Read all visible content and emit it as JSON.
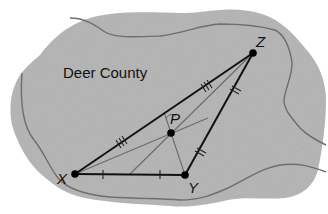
{
  "region": {
    "label": "Deer County",
    "fill": "#b9b9b9",
    "border_color": "#6e6e6e"
  },
  "points": {
    "X": {
      "label": "X",
      "x": 75,
      "y": 174
    },
    "Y": {
      "label": "Y",
      "x": 185,
      "y": 175
    },
    "Z": {
      "label": "Z",
      "x": 253,
      "y": 53
    },
    "P": {
      "label": "P",
      "x": 171,
      "y": 133
    }
  },
  "triangle": {
    "sides": [
      {
        "from": "X",
        "to": "Y",
        "tick_marks": 1,
        "tick_count": 2
      },
      {
        "from": "Y",
        "to": "Z",
        "tick_marks": 2,
        "tick_count": 2
      },
      {
        "from": "X",
        "to": "Z",
        "tick_marks": 3,
        "tick_count": 2
      }
    ],
    "stroke": "#111111",
    "inner_line_color": "#6a6a6a"
  }
}
